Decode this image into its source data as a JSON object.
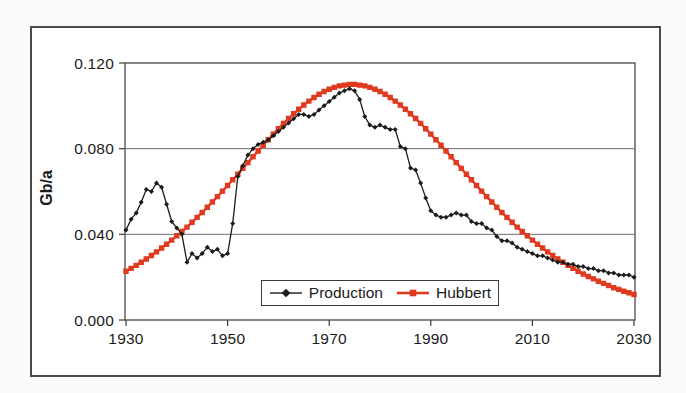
{
  "figure": {
    "title": "",
    "y_axis_title": "Gb/a"
  },
  "colors": {
    "production": "#1c1c1c",
    "hubbert": "#df3a1f",
    "grid": "#6e6e6e",
    "axis": "#3d3d3d",
    "plot_background": "#ffffff",
    "page_background": "#fbfaf8",
    "text": "#1b1b1b"
  },
  "chart_data": {
    "type": "line",
    "title": "",
    "xlabel": "",
    "ylabel": "Gb/a",
    "xlim": [
      1930,
      2030
    ],
    "ylim": [
      0,
      0.12
    ],
    "grid": "horizontal",
    "legend": {
      "position": "inside-bottom-center",
      "entries": [
        "Production",
        "Hubbert"
      ]
    },
    "x_ticks": [
      1930,
      1950,
      1970,
      1990,
      2010,
      2030
    ],
    "y_ticks": [
      {
        "label": "0.000",
        "value": 0.0
      },
      {
        "label": "0.040",
        "value": 0.04
      },
      {
        "label": "0.080",
        "value": 0.08
      },
      {
        "label": "0.120",
        "value": 0.12
      }
    ],
    "x_start": 1930,
    "x_step": 1,
    "series": [
      {
        "name": "Production",
        "marker": "diamond",
        "color": "#1c1c1c",
        "values": [
          0.042,
          0.047,
          0.05,
          0.055,
          0.061,
          0.06,
          0.064,
          0.062,
          0.054,
          0.046,
          0.043,
          0.04,
          0.027,
          0.031,
          0.029,
          0.031,
          0.034,
          0.032,
          0.033,
          0.03,
          0.031,
          0.045,
          0.067,
          0.072,
          0.077,
          0.08,
          0.082,
          0.083,
          0.084,
          0.086,
          0.088,
          0.09,
          0.092,
          0.094,
          0.096,
          0.096,
          0.095,
          0.096,
          0.098,
          0.1,
          0.102,
          0.104,
          0.106,
          0.107,
          0.108,
          0.107,
          0.103,
          0.095,
          0.091,
          0.09,
          0.091,
          0.09,
          0.089,
          0.089,
          0.081,
          0.08,
          0.071,
          0.07,
          0.064,
          0.057,
          0.051,
          0.049,
          0.048,
          0.048,
          0.049,
          0.05,
          0.049,
          0.049,
          0.046,
          0.045,
          0.045,
          0.043,
          0.042,
          0.039,
          0.037,
          0.037,
          0.036,
          0.034,
          0.033,
          0.032,
          0.031,
          0.03,
          0.03,
          0.029,
          0.028,
          0.027,
          0.027,
          0.026,
          0.026,
          0.025,
          0.025,
          0.024,
          0.024,
          0.023,
          0.023,
          0.022,
          0.022,
          0.021,
          0.021,
          0.021,
          0.02
        ]
      },
      {
        "name": "Hubbert",
        "marker": "square",
        "color": "#df3a1f",
        "values": [
          0.0228,
          0.0241,
          0.0255,
          0.027,
          0.0285,
          0.0301,
          0.0318,
          0.0336,
          0.0354,
          0.0373,
          0.0393,
          0.0413,
          0.0434,
          0.0456,
          0.0479,
          0.0502,
          0.0526,
          0.0551,
          0.0576,
          0.0602,
          0.0628,
          0.0655,
          0.0681,
          0.0708,
          0.0735,
          0.0762,
          0.0789,
          0.0816,
          0.0842,
          0.0868,
          0.0893,
          0.0918,
          0.0941,
          0.0963,
          0.0984,
          0.1004,
          0.1022,
          0.1039,
          0.1054,
          0.1067,
          0.1077,
          0.1086,
          0.1093,
          0.1097,
          0.11,
          0.11,
          0.1097,
          0.1093,
          0.1086,
          0.1077,
          0.1067,
          0.1054,
          0.1039,
          0.1022,
          0.1004,
          0.0984,
          0.0963,
          0.0941,
          0.0918,
          0.0893,
          0.0868,
          0.0842,
          0.0816,
          0.0789,
          0.0762,
          0.0735,
          0.0708,
          0.0681,
          0.0655,
          0.0628,
          0.0602,
          0.0576,
          0.0551,
          0.0526,
          0.0502,
          0.0479,
          0.0456,
          0.0434,
          0.0413,
          0.0393,
          0.0373,
          0.0354,
          0.0336,
          0.0318,
          0.0301,
          0.0285,
          0.027,
          0.0255,
          0.0241,
          0.0228,
          0.0215,
          0.0203,
          0.0192,
          0.0181,
          0.0171,
          0.0161,
          0.0151,
          0.0143,
          0.0134,
          0.0127,
          0.0119
        ]
      }
    ]
  }
}
